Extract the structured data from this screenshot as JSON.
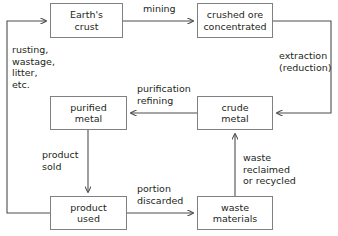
{
  "diagram": {
    "background_color": "#ffffff",
    "line_color": "#4d4d4d",
    "box_border_color": "#808080",
    "text_color": "#231f20"
  },
  "nodes": [
    {
      "id": "earths-crust",
      "line1": "Earth's",
      "line2": "crust"
    },
    {
      "id": "crushed-ore",
      "line1": "crushed ore",
      "line2": "concentrated"
    },
    {
      "id": "purified-metal",
      "line1": "purified",
      "line2": "metal"
    },
    {
      "id": "crude-metal",
      "line1": "crude",
      "line2": "metal"
    },
    {
      "id": "product-used",
      "line1": "product",
      "line2": "used"
    },
    {
      "id": "waste-materials",
      "line1": "waste",
      "line2": "materials"
    }
  ],
  "edge_labels": {
    "mining": {
      "line1": "mining"
    },
    "extraction": {
      "line1": "extraction",
      "line2": "(reduction)"
    },
    "purification": {
      "line1": "purification",
      "line2": "refining"
    },
    "rusting": {
      "line1": "rusting,",
      "line2": "wastage,",
      "line3": "litter,",
      "line4": "etc."
    },
    "product_sold": {
      "line1": "product",
      "line2": "sold"
    },
    "portion": {
      "line1": "portion",
      "line2": "discarded"
    },
    "waste_reclaimed": {
      "line1": "waste",
      "line2": "reclaimed",
      "line3": "or recycled"
    }
  }
}
